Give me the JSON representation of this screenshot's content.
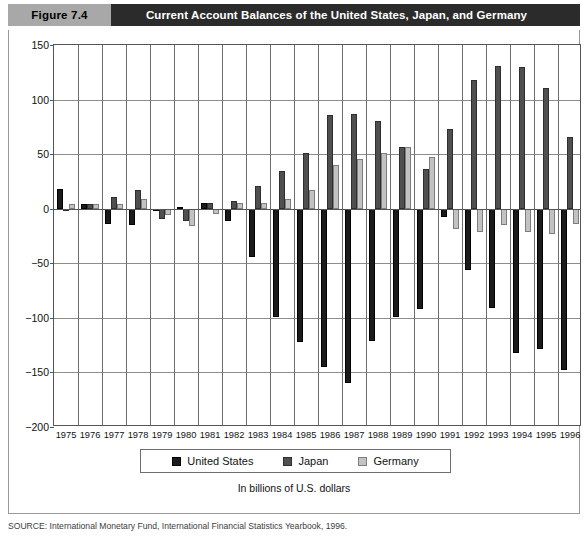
{
  "header": {
    "figure_tag": "Figure 7.4",
    "title": "Current Account Balances of the United States, Japan, and Germany"
  },
  "subtitle": "In billions of U.S. dollars",
  "source": "SOURCE: International Monetary Fund, International Financial Statistics Yearbook, 1996.",
  "colors": {
    "united_states": "#1b1b1b",
    "japan": "#4f4f4f",
    "germany": "#c2c2c2",
    "header_tag_bg": "#a8a8a8",
    "header_bar_bg": "#2b2b2b"
  },
  "legend": {
    "items": [
      {
        "label": "United States",
        "key": "us"
      },
      {
        "label": "Japan",
        "key": "jp"
      },
      {
        "label": "Germany",
        "key": "de"
      }
    ]
  },
  "chart_data": {
    "type": "bar",
    "title": "Current Account Balances of the United States, Japan, and Germany",
    "subtitle": "In billions of U.S. dollars",
    "xlabel": "",
    "ylabel": "",
    "ylim": [
      -200,
      150
    ],
    "yticks": [
      150,
      100,
      50,
      0,
      -50,
      -100,
      -150,
      -200
    ],
    "grid": true,
    "legend_position": "bottom",
    "categories": [
      "1975",
      "1976",
      "1977",
      "1978",
      "1979",
      "1980",
      "1981",
      "1982",
      "1983",
      "1984",
      "1985",
      "1986",
      "1987",
      "1988",
      "1989",
      "1990",
      "1991",
      "1992",
      "1993",
      "1994",
      "1995",
      "1996"
    ],
    "series": [
      {
        "name": "United States",
        "key": "us",
        "color": "#1b1b1b",
        "values": [
          18,
          4,
          -14,
          -15,
          -1,
          2,
          5,
          -11,
          -44,
          -99,
          -122,
          -145,
          -160,
          -121,
          -99,
          -92,
          -8,
          -56,
          -91,
          -132,
          -129,
          -148
        ]
      },
      {
        "name": "Japan",
        "key": "jp",
        "color": "#4f4f4f",
        "values": [
          -1,
          4,
          11,
          17,
          -9,
          -11,
          5,
          7,
          21,
          35,
          51,
          86,
          87,
          80,
          57,
          36,
          73,
          118,
          131,
          130,
          111,
          66
        ]
      },
      {
        "name": "Germany",
        "key": "de",
        "color": "#c2c2c2",
        "values": [
          4,
          4,
          4,
          9,
          -6,
          -16,
          -5,
          5,
          5,
          9,
          17,
          40,
          46,
          51,
          57,
          47,
          -19,
          -21,
          -15,
          -21,
          -23,
          -14
        ]
      }
    ]
  }
}
